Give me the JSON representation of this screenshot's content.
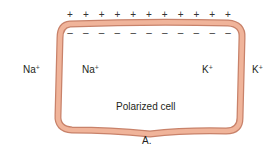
{
  "diagram": {
    "panel_label": "A.",
    "cell_label": "Polarized cell",
    "outside_charge_symbol": "+",
    "inside_charge_symbol": "–",
    "outside_charge_count": 11,
    "inside_charge_count": 11,
    "ions": {
      "outside_left": {
        "symbol": "Na",
        "charge": "+"
      },
      "inside_left": {
        "symbol": "Na",
        "charge": "+"
      },
      "inside_right": {
        "symbol": "K",
        "charge": "+"
      },
      "outside_right": {
        "symbol": "K",
        "charge": "+"
      }
    },
    "colors": {
      "membrane_fill": "#f0b49a",
      "membrane_edge": "#c8826a",
      "text": "#231f20"
    }
  }
}
